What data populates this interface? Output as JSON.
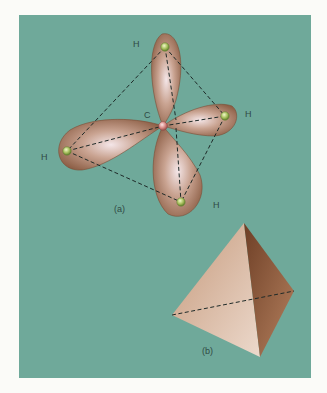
{
  "figure": {
    "panel_color": "#6fa99a",
    "part_a": {
      "label": "(a)",
      "center_atom": "C",
      "atoms": [
        {
          "symbol": "H",
          "position": "top"
        },
        {
          "symbol": "H",
          "position": "right"
        },
        {
          "symbol": "H",
          "position": "left"
        },
        {
          "symbol": "H",
          "position": "bottom"
        }
      ]
    },
    "part_b": {
      "label": "(b)"
    }
  }
}
